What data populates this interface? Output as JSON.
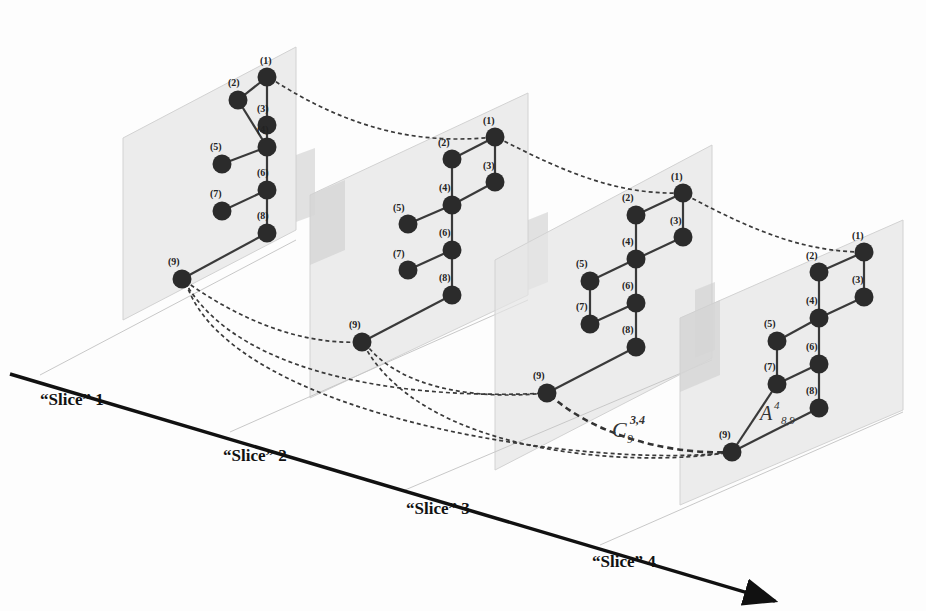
{
  "figure": {
    "type": "multi-slice graph diagram",
    "axis": {
      "direction": "arrow pointing bottom-right",
      "color": "#111111"
    },
    "slices": [
      {
        "label": "“Slice” 1",
        "node_labels": [
          "(1)",
          "(2)",
          "(3)",
          "(4)",
          "(5)",
          "(6)",
          "(7)",
          "(8)",
          "(9)"
        ],
        "edges": [
          [
            1,
            2
          ],
          [
            1,
            3
          ],
          [
            2,
            4
          ],
          [
            3,
            4
          ],
          [
            4,
            5
          ],
          [
            4,
            6
          ],
          [
            6,
            7
          ],
          [
            6,
            8
          ],
          [
            8,
            9
          ]
        ]
      },
      {
        "label": "“Slice” 2",
        "node_labels": [
          "(1)",
          "(2)",
          "(3)",
          "(4)",
          "(5)",
          "(6)",
          "(7)",
          "(8)",
          "(9)"
        ],
        "edges": [
          [
            1,
            2
          ],
          [
            1,
            3
          ],
          [
            2,
            4
          ],
          [
            3,
            4
          ],
          [
            4,
            5
          ],
          [
            4,
            6
          ],
          [
            6,
            7
          ],
          [
            6,
            8
          ],
          [
            8,
            9
          ]
        ]
      },
      {
        "label": "“Slice” 3",
        "node_labels": [
          "(1)",
          "(2)",
          "(3)",
          "(4)",
          "(5)",
          "(6)",
          "(7)",
          "(8)",
          "(9)"
        ],
        "edges": [
          [
            1,
            2
          ],
          [
            1,
            3
          ],
          [
            2,
            4
          ],
          [
            3,
            4
          ],
          [
            4,
            5
          ],
          [
            4,
            6
          ],
          [
            5,
            7
          ],
          [
            6,
            7
          ],
          [
            6,
            8
          ],
          [
            8,
            9
          ]
        ]
      },
      {
        "label": "“Slice” 4",
        "node_labels": [
          "(1)",
          "(2)",
          "(3)",
          "(4)",
          "(5)",
          "(6)",
          "(7)",
          "(8)",
          "(9)"
        ],
        "edges": [
          [
            1,
            2
          ],
          [
            1,
            3
          ],
          [
            2,
            4
          ],
          [
            3,
            4
          ],
          [
            4,
            5
          ],
          [
            4,
            6
          ],
          [
            5,
            7
          ],
          [
            6,
            7
          ],
          [
            6,
            8
          ],
          [
            7,
            9
          ],
          [
            8,
            9
          ]
        ]
      }
    ],
    "annotations": {
      "coupling": {
        "base": "C",
        "sub": "9",
        "sup": "3,4"
      },
      "adjacency": {
        "base": "A",
        "sup": "4",
        "sub": "8,9"
      }
    },
    "node_color": "#2b2b2b",
    "plane_color": "#e4e4e4"
  }
}
